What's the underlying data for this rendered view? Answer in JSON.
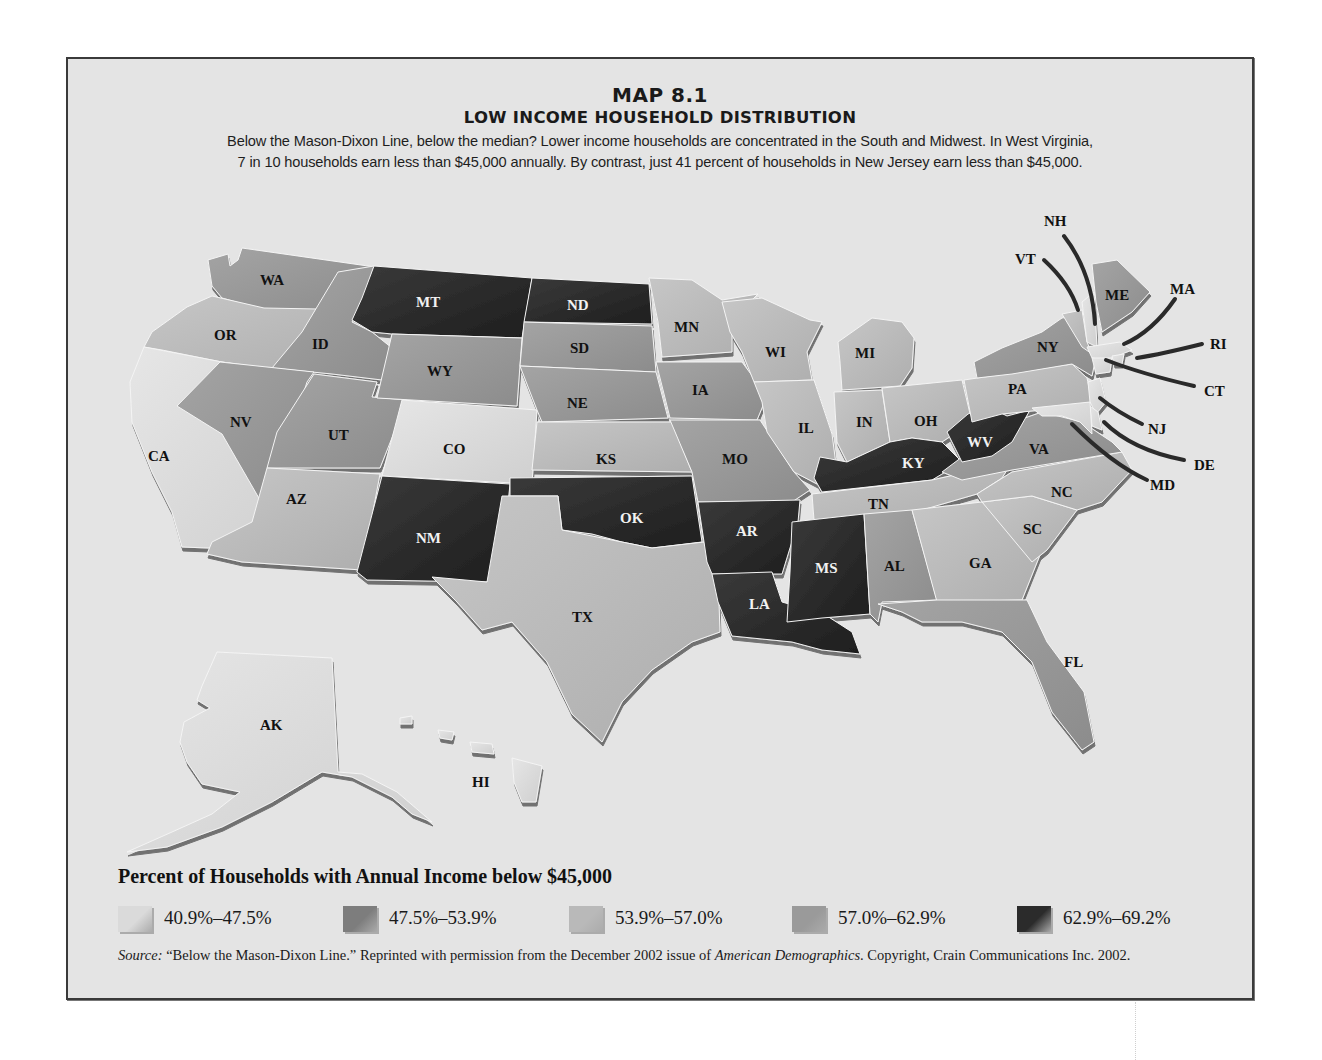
{
  "header": {
    "map_number": "MAP 8.1",
    "title": "LOW INCOME HOUSEHOLD DISTRIBUTION",
    "description_line1": "Below the Mason-Dixon Line, below the median? Lower income households are concentrated in the South and Midwest. In West Virginia,",
    "description_line2": "7 in 10 households earn less than $45,000 annually. By contrast, just 41 percent of households in New Jersey earn less than $45,000."
  },
  "legend": {
    "title": "Percent of Households with Annual Income below $45,000",
    "classes": [
      {
        "id": "c1",
        "label": "40.9%–47.5%",
        "color": "#dadada"
      },
      {
        "id": "c2",
        "label": "47.5%–53.9%",
        "color": "#7d7d7d"
      },
      {
        "id": "c3",
        "label": "53.9%–57.0%",
        "color": "#b9b9b9"
      },
      {
        "id": "c4",
        "label": "57.0%–62.9%",
        "color": "#9a9a9a"
      },
      {
        "id": "c5",
        "label": "62.9%–69.2%",
        "color": "#2b2b2b"
      }
    ]
  },
  "source": {
    "prefix": "Source:",
    "text1": " “Below the Mason-Dixon Line.” Reprinted with permission from the December 2002 issue of ",
    "publication": "American Demographics",
    "text2": ". Copyright, Crain Communications Inc. 2002."
  },
  "map": {
    "states": [
      {
        "abbr": "WA",
        "class": "c4"
      },
      {
        "abbr": "OR",
        "class": "c3"
      },
      {
        "abbr": "CA",
        "class": "c1"
      },
      {
        "abbr": "ID",
        "class": "c4"
      },
      {
        "abbr": "NV",
        "class": "c4"
      },
      {
        "abbr": "UT",
        "class": "c4"
      },
      {
        "abbr": "AZ",
        "class": "c3"
      },
      {
        "abbr": "MT",
        "class": "c5"
      },
      {
        "abbr": "WY",
        "class": "c4"
      },
      {
        "abbr": "CO",
        "class": "c1"
      },
      {
        "abbr": "NM",
        "class": "c5"
      },
      {
        "abbr": "ND",
        "class": "c5"
      },
      {
        "abbr": "SD",
        "class": "c4"
      },
      {
        "abbr": "NE",
        "class": "c4"
      },
      {
        "abbr": "KS",
        "class": "c3"
      },
      {
        "abbr": "OK",
        "class": "c5"
      },
      {
        "abbr": "TX",
        "class": "c3"
      },
      {
        "abbr": "MN",
        "class": "c3"
      },
      {
        "abbr": "IA",
        "class": "c4"
      },
      {
        "abbr": "MO",
        "class": "c4"
      },
      {
        "abbr": "AR",
        "class": "c5"
      },
      {
        "abbr": "LA",
        "class": "c5"
      },
      {
        "abbr": "WI",
        "class": "c3"
      },
      {
        "abbr": "IL",
        "class": "c3"
      },
      {
        "abbr": "MI",
        "class": "c3"
      },
      {
        "abbr": "IN",
        "class": "c3"
      },
      {
        "abbr": "OH",
        "class": "c3"
      },
      {
        "abbr": "KY",
        "class": "c5"
      },
      {
        "abbr": "TN",
        "class": "c3"
      },
      {
        "abbr": "MS",
        "class": "c5"
      },
      {
        "abbr": "AL",
        "class": "c4"
      },
      {
        "abbr": "GA",
        "class": "c3"
      },
      {
        "abbr": "FL",
        "class": "c4"
      },
      {
        "abbr": "SC",
        "class": "c3"
      },
      {
        "abbr": "NC",
        "class": "c3"
      },
      {
        "abbr": "VA",
        "class": "c4"
      },
      {
        "abbr": "WV",
        "class": "c5"
      },
      {
        "abbr": "PA",
        "class": "c3"
      },
      {
        "abbr": "NY",
        "class": "c4"
      },
      {
        "abbr": "ME",
        "class": "c4"
      },
      {
        "abbr": "VT",
        "class": "c3"
      },
      {
        "abbr": "NH",
        "class": "c1"
      },
      {
        "abbr": "MA",
        "class": "c1"
      },
      {
        "abbr": "RI",
        "class": "c1"
      },
      {
        "abbr": "CT",
        "class": "c1"
      },
      {
        "abbr": "NJ",
        "class": "c1"
      },
      {
        "abbr": "DE",
        "class": "c1"
      },
      {
        "abbr": "MD",
        "class": "c1"
      },
      {
        "abbr": "AK",
        "class": "c1"
      },
      {
        "abbr": "HI",
        "class": "c1"
      }
    ],
    "callout_labels": [
      "NH",
      "VT",
      "ME",
      "MA",
      "RI",
      "CT",
      "NJ",
      "DE",
      "MD"
    ]
  }
}
